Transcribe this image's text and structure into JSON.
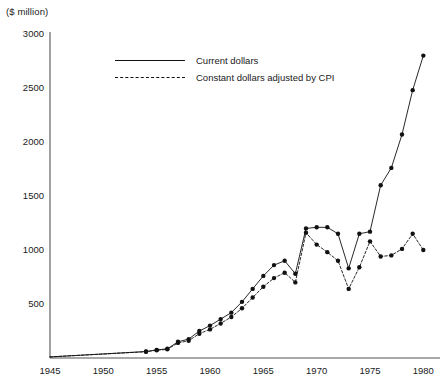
{
  "chart_data": {
    "type": "line",
    "title": "",
    "unit_label": "($ million)",
    "xlabel": "",
    "ylabel": "",
    "xlim": [
      1945,
      1981
    ],
    "ylim": [
      0,
      3000
    ],
    "grid": false,
    "legend_position": "upper-left-inset",
    "xticks": [
      1945,
      1950,
      1955,
      1960,
      1965,
      1970,
      1975,
      1980
    ],
    "yticks": [
      0,
      500,
      1000,
      1500,
      2000,
      2500,
      3000
    ],
    "series": [
      {
        "name": "Current dollars",
        "style": "solid",
        "marker": "filled-circle",
        "color": "#111111",
        "x": [
          1945,
          1954,
          1955,
          1956,
          1957,
          1958,
          1959,
          1960,
          1961,
          1962,
          1963,
          1964,
          1965,
          1966,
          1967,
          1968,
          1969,
          1970,
          1971,
          1972,
          1973,
          1974,
          1975,
          1976,
          1977,
          1978,
          1979,
          1980
        ],
        "values": [
          10,
          60,
          75,
          85,
          150,
          175,
          250,
          300,
          360,
          420,
          520,
          640,
          760,
          860,
          900,
          780,
          1200,
          1210,
          1210,
          1150,
          830,
          1150,
          1170,
          1600,
          1760,
          2070,
          2480,
          2800
        ]
      },
      {
        "name": "Constant dollars adjusted by CPI",
        "style": "dashed",
        "marker": "filled-circle",
        "color": "#111111",
        "x": [
          1945,
          1954,
          1955,
          1956,
          1957,
          1958,
          1959,
          1960,
          1961,
          1962,
          1963,
          1964,
          1965,
          1966,
          1967,
          1968,
          1969,
          1970,
          1971,
          1972,
          1973,
          1974,
          1975,
          1976,
          1977,
          1978,
          1979,
          1980
        ],
        "values": [
          10,
          58,
          72,
          80,
          140,
          160,
          225,
          265,
          320,
          380,
          460,
          560,
          660,
          740,
          790,
          700,
          1160,
          1050,
          980,
          900,
          640,
          840,
          1080,
          940,
          950,
          1010,
          1150,
          1000
        ]
      }
    ]
  },
  "legend": {
    "items": [
      {
        "label": "Current dollars",
        "style": "solid"
      },
      {
        "label": "Constant dollars adjusted by CPI",
        "style": "dashed"
      }
    ]
  }
}
